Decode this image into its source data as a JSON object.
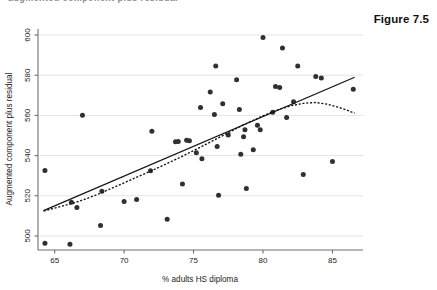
{
  "page": {
    "figure_label": "Figure 7.5",
    "top_clipped_text": "augmented component plus residual"
  },
  "chart_data": {
    "type": "scatter",
    "title": "",
    "xlabel": "% adults HS diploma",
    "ylabel": "Augmented component plus residual",
    "xlim": [
      63.8,
      87.2
    ],
    "ylim": [
      493,
      603
    ],
    "xticks": [
      65,
      70,
      75,
      80,
      85
    ],
    "yticks": [
      500,
      520,
      540,
      560,
      580,
      600
    ],
    "xtick_labels": [
      "65",
      "70",
      "75",
      "80",
      "85"
    ],
    "ytick_labels": [
      "500",
      "520",
      "540",
      "560",
      "580",
      "600"
    ],
    "grid": "horizontal",
    "legend": "none",
    "marker_color": "#2f2f34",
    "line_color": "#141414",
    "points": [
      [
        64.3,
        496.3
      ],
      [
        64.3,
        532.6
      ],
      [
        66.1,
        495.8
      ],
      [
        66.2,
        516.8
      ],
      [
        66.6,
        514.2
      ],
      [
        67.0,
        560.1
      ],
      [
        68.3,
        505.2
      ],
      [
        68.4,
        522.3
      ],
      [
        70.0,
        517.1
      ],
      [
        70.9,
        518.1
      ],
      [
        71.9,
        532.4
      ],
      [
        72.0,
        552.1
      ],
      [
        73.1,
        508.3
      ],
      [
        73.7,
        546.9
      ],
      [
        73.9,
        547.0
      ],
      [
        74.2,
        525.9
      ],
      [
        74.5,
        547.6
      ],
      [
        74.7,
        547.4
      ],
      [
        75.2,
        541.4
      ],
      [
        75.5,
        563.9
      ],
      [
        75.6,
        538.4
      ],
      [
        76.2,
        571.6
      ],
      [
        76.5,
        560.4
      ],
      [
        76.6,
        584.6
      ],
      [
        76.7,
        544.5
      ],
      [
        76.8,
        520.3
      ],
      [
        77.1,
        565.8
      ],
      [
        77.5,
        550.3
      ],
      [
        78.1,
        577.8
      ],
      [
        78.3,
        562.9
      ],
      [
        78.4,
        540.7
      ],
      [
        78.6,
        549.4
      ],
      [
        78.7,
        552.8
      ],
      [
        78.8,
        523.6
      ],
      [
        79.3,
        542.9
      ],
      [
        79.6,
        555.1
      ],
      [
        79.8,
        552.9
      ],
      [
        80.0,
        598.8
      ],
      [
        80.7,
        561.6
      ],
      [
        80.9,
        574.4
      ],
      [
        81.2,
        573.9
      ],
      [
        81.4,
        593.5
      ],
      [
        81.7,
        558.9
      ],
      [
        82.2,
        566.8
      ],
      [
        82.5,
        584.6
      ],
      [
        82.9,
        530.6
      ],
      [
        83.8,
        579.3
      ],
      [
        84.2,
        578.6
      ],
      [
        85.0,
        537.1
      ],
      [
        86.5,
        573.0
      ]
    ],
    "series": [
      {
        "name": "linear fit",
        "style": "solid",
        "x": [
          64.2,
          86.6
        ],
        "y": [
          512.6,
          579.0
        ]
      },
      {
        "name": "lowess smooth",
        "style": "dotted",
        "points": [
          [
            64.2,
            512.4
          ],
          [
            65.5,
            514.8
          ],
          [
            66.5,
            516.6
          ],
          [
            68.0,
            520.4
          ],
          [
            69.5,
            524.9
          ],
          [
            71.0,
            529.5
          ],
          [
            72.5,
            534.1
          ],
          [
            74.0,
            539.0
          ],
          [
            75.5,
            544.2
          ],
          [
            77.0,
            549.6
          ],
          [
            78.5,
            555.0
          ],
          [
            80.0,
            559.8
          ],
          [
            81.0,
            562.6
          ],
          [
            82.0,
            564.8
          ],
          [
            83.0,
            566.1
          ],
          [
            83.8,
            566.4
          ],
          [
            84.6,
            565.6
          ],
          [
            85.4,
            564.1
          ],
          [
            86.0,
            562.7
          ],
          [
            86.6,
            561.1
          ]
        ]
      }
    ]
  }
}
